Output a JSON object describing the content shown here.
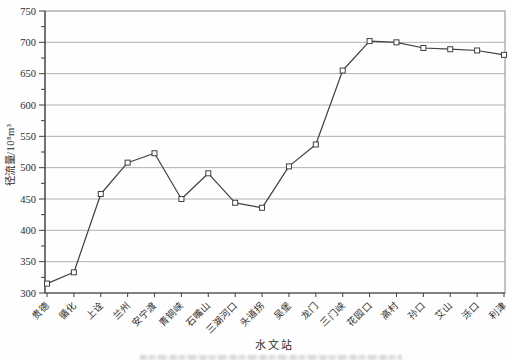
{
  "chart_data": {
    "type": "line",
    "title": "",
    "xlabel": "水文站",
    "ylabel": "径流量/10⁸m³",
    "categories": [
      "贵德",
      "循化",
      "上诠",
      "兰州",
      "安宁渡",
      "青铜峡",
      "石嘴山",
      "三湖河口",
      "头道拐",
      "吴堡",
      "龙门",
      "三门峡",
      "花园口",
      "高村",
      "孙口",
      "艾山",
      "泺口",
      "利津"
    ],
    "values": [
      315,
      333,
      458,
      508,
      523,
      450,
      491,
      444,
      436,
      502,
      537,
      655,
      702,
      700,
      691,
      689,
      687,
      680
    ],
    "ylim": [
      300,
      750
    ],
    "ytick_step": 50,
    "ytick_labels": [
      "300",
      "350",
      "400",
      "450",
      "500",
      "550",
      "600",
      "650",
      "700",
      "750"
    ],
    "grid": true,
    "legend": "none",
    "marker": "open-square",
    "colors": {
      "line": "#3f3f3f",
      "marker_fill": "#ffffff",
      "grid": "#b0b0b0",
      "axis": "#3f3f3f",
      "plot_border": "#8a8a8a",
      "text": "#2b2b2b"
    }
  }
}
